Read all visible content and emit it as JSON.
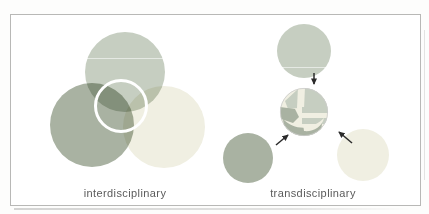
{
  "figure": {
    "type": "venn-vs-network-diagram",
    "panels": {
      "left": {
        "label": "interdisciplinary"
      },
      "right": {
        "label": "transdisciplinary"
      }
    }
  },
  "colors": {
    "frame_border": "#b8b8b6",
    "canvas_background": "#ffffff",
    "sage_green": "#c6cec1",
    "olive_green": "#a9b2a2",
    "pale_cream": "#f0efe2",
    "center_ring": "#ffffff",
    "arrow": "#2b2b2b",
    "label_text": "#5b5b5b"
  }
}
